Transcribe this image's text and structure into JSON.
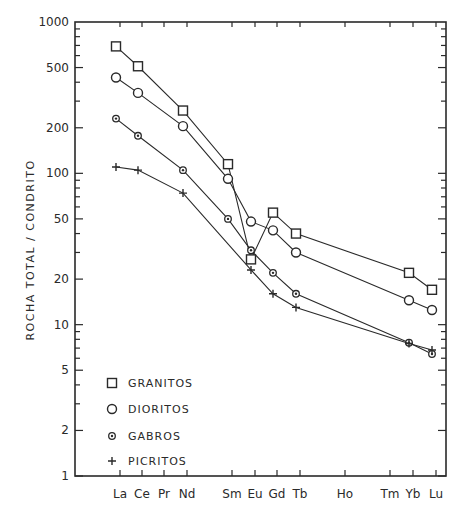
{
  "chart_data": {
    "type": "line",
    "title": "",
    "xlabel": "",
    "ylabel": "ROCHA TOTAL / CONDRITO",
    "yscale": "log",
    "ylim": [
      1,
      1000
    ],
    "yticks": [
      1,
      2,
      5,
      10,
      20,
      50,
      100,
      200,
      500,
      1000
    ],
    "grid": false,
    "legend_position": "lower-left-inside",
    "categories": [
      "La",
      "Ce",
      "Pr",
      "Nd",
      "Sm",
      "Eu",
      "Gd",
      "Tb",
      "Ho",
      "Tm",
      "Yb",
      "Lu"
    ],
    "series": [
      {
        "name": "GRANITOS",
        "marker": "square",
        "values": [
          690,
          510,
          null,
          260,
          115,
          27,
          55,
          40,
          null,
          null,
          22,
          17
        ]
      },
      {
        "name": "DIORITOS",
        "marker": "circle",
        "values": [
          430,
          340,
          null,
          205,
          92,
          48,
          42,
          30,
          null,
          null,
          14.5,
          12.5
        ]
      },
      {
        "name": "GABROS",
        "marker": "dotted-circle",
        "values": [
          230,
          177,
          null,
          105,
          50,
          31,
          22,
          16,
          null,
          null,
          7.6,
          6.4
        ]
      },
      {
        "name": "PICRITOS",
        "marker": "plus",
        "values": [
          110,
          105,
          null,
          74,
          null,
          23,
          16,
          13,
          null,
          null,
          7.5,
          6.8
        ]
      }
    ]
  },
  "legend": {
    "items": [
      {
        "symbol": "square",
        "label": "GRANITOS"
      },
      {
        "symbol": "circle",
        "label": "DIORITOS"
      },
      {
        "symbol": "dotted-circle",
        "label": "GABROS"
      },
      {
        "symbol": "plus",
        "label": "PICRITOS"
      }
    ]
  },
  "axes": {
    "ylabel": "ROCHA TOTAL / CONDRITO",
    "ytick_labels": [
      "1",
      "2",
      "5",
      "10",
      "20",
      "50",
      "100",
      "200",
      "500",
      "1000"
    ],
    "xtick_labels": [
      "La",
      "Ce",
      "Pr",
      "Nd",
      "Sm",
      "Eu",
      "Gd",
      "Tb",
      "Ho",
      "Tm",
      "Yb",
      "Lu"
    ]
  },
  "colors": {
    "ink": "#2a2a2a",
    "background": "#ffffff"
  }
}
